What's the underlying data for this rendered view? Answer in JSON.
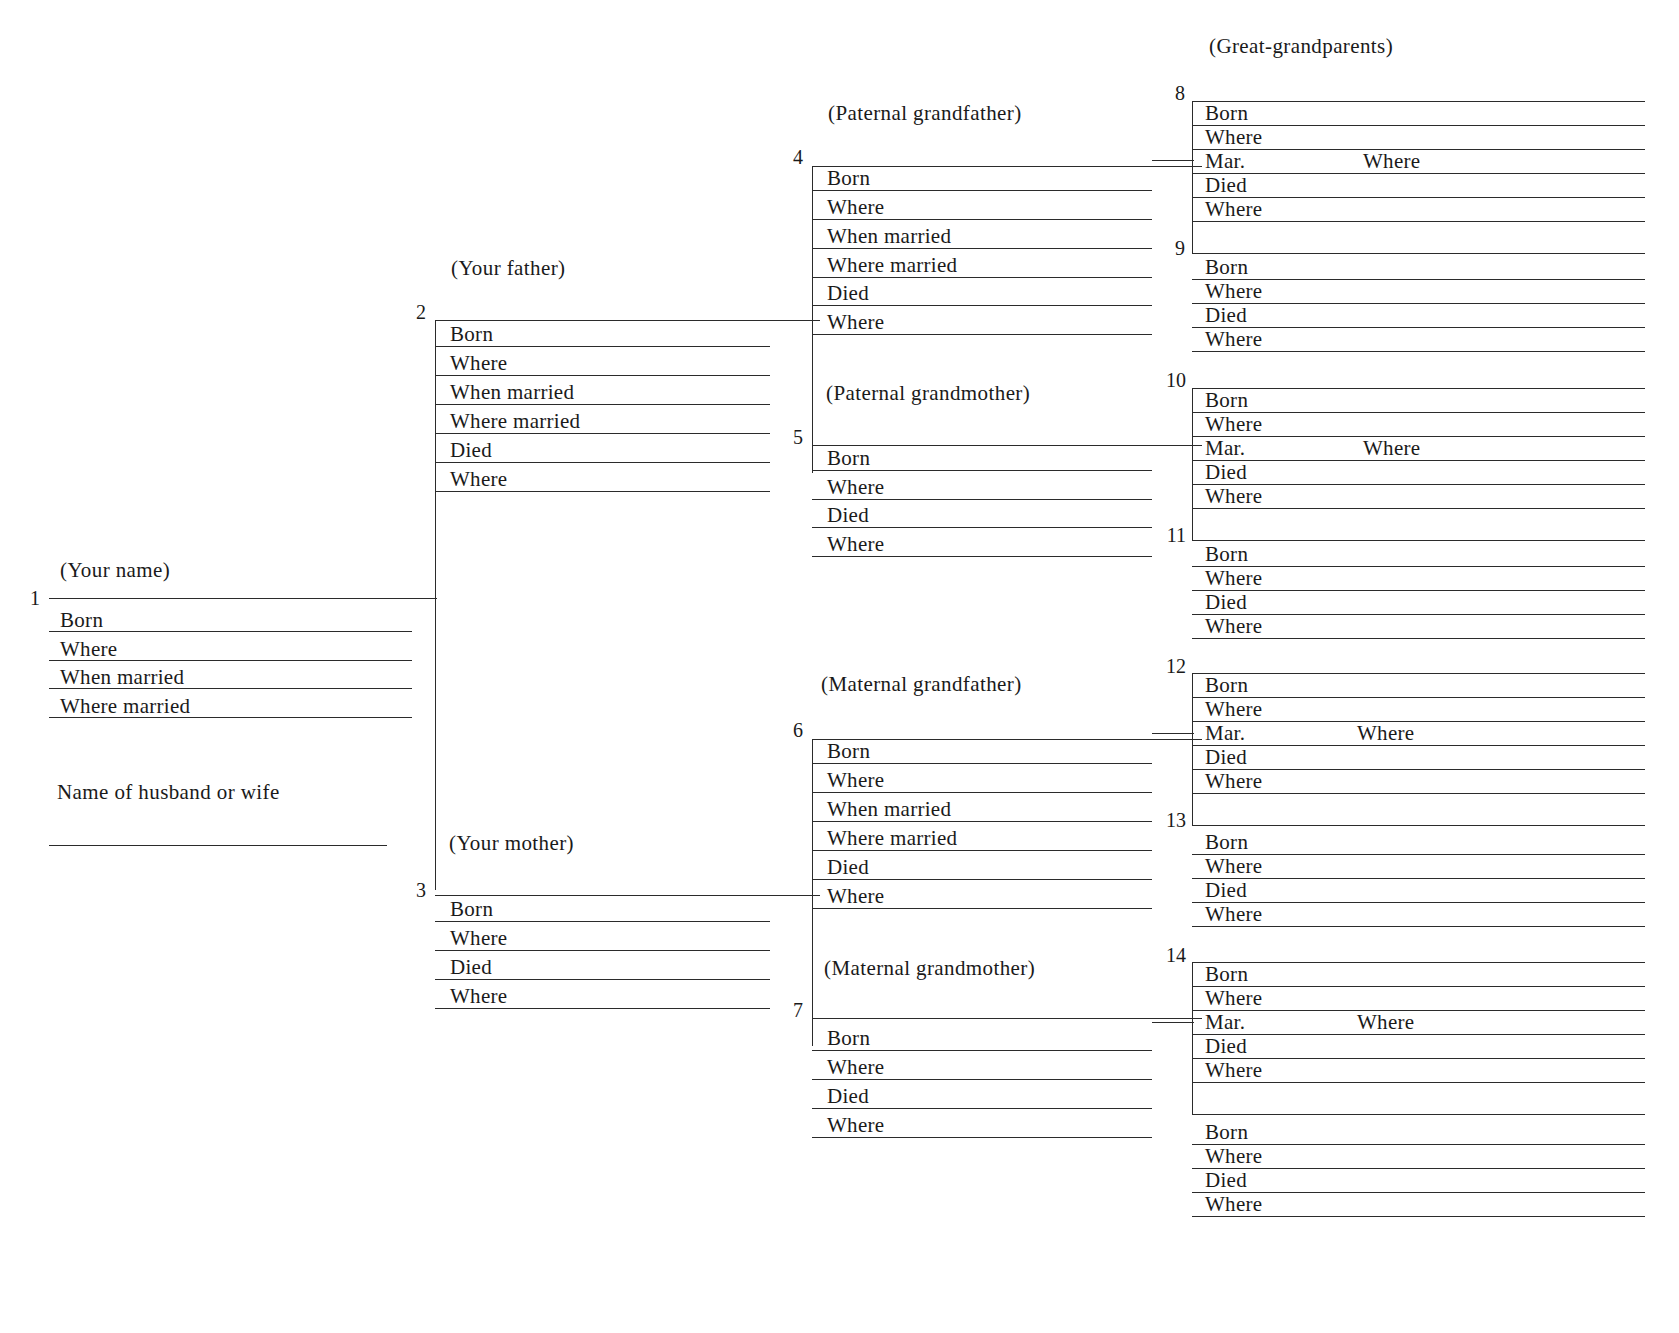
{
  "chart": {
    "title_great_grandparents": "(Great-grandparents)",
    "row_labels": {
      "born": "Born",
      "where": "Where",
      "when_married": "When married",
      "where_married": "Where married",
      "died": "Died",
      "mar": "Mar."
    }
  },
  "person_1": {
    "number": "1",
    "label": "(Your name)",
    "rows": [
      "Born",
      "Where",
      "When married",
      "Where married"
    ],
    "spouse_label": "Name of husband or wife"
  },
  "person_2": {
    "number": "2",
    "label": "(Your father)",
    "rows": [
      "Born",
      "Where",
      "When married",
      "Where married",
      "Died",
      "Where"
    ]
  },
  "person_3": {
    "number": "3",
    "label": "(Your  mother)",
    "rows": [
      "Born",
      "Where",
      "Died",
      "Where"
    ]
  },
  "person_4": {
    "number": "4",
    "label": "(Paternal grandfather)",
    "rows": [
      "Born",
      "Where",
      "When married",
      "Where married",
      "Died",
      "Where"
    ]
  },
  "person_5": {
    "number": "5",
    "label": "(Paternal grandmother)",
    "rows": [
      "Born",
      "Where",
      "Died",
      "Where"
    ]
  },
  "person_6": {
    "number": "6",
    "label": "(Maternal grandfather)",
    "rows": [
      "Born",
      "Where",
      "When married",
      "Where married",
      "Died",
      "Where"
    ]
  },
  "person_7": {
    "number": "7",
    "label": "(Maternal grandmother)",
    "rows": [
      "Born",
      "Where",
      "Died",
      "Where"
    ]
  },
  "person_8": {
    "number": "8",
    "rows": [
      "Born",
      "Where",
      "Mar.",
      "Died",
      "Where",
      ""
    ],
    "mar_where": "Where"
  },
  "person_9": {
    "number": "9",
    "rows": [
      "Born",
      "Where",
      "Died",
      "Where"
    ]
  },
  "person_10": {
    "number": "10",
    "rows": [
      "Born",
      "Where",
      "Mar.",
      "Died",
      "Where",
      ""
    ],
    "mar_where": "Where"
  },
  "person_11": {
    "number": "11",
    "rows": [
      "Born",
      "Where",
      "Died",
      "Where"
    ]
  },
  "person_12": {
    "number": "12",
    "rows": [
      "Born",
      "Where",
      "Mar.",
      "Died",
      "Where",
      ""
    ],
    "mar_where": "Where"
  },
  "person_13": {
    "number": "13",
    "rows": [
      "Born",
      "Where",
      "Died",
      "Where"
    ]
  },
  "person_14": {
    "number": "14",
    "rows": [
      "Born",
      "Where",
      "Mar.",
      "Died",
      "Where",
      ""
    ],
    "mar_where": "Where"
  },
  "person_15": {
    "number": "",
    "rows": [
      "Born",
      "Where",
      "Died",
      "Where"
    ]
  }
}
